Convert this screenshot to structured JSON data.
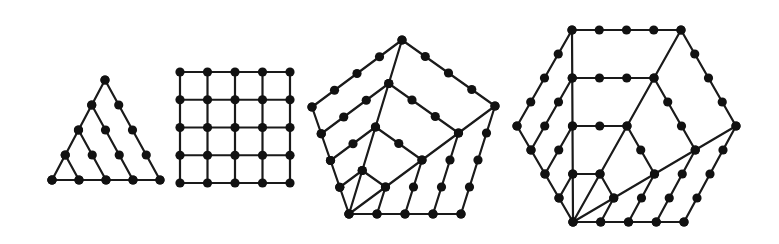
{
  "colors": {
    "line": "#1a1a1a",
    "dot": "#111111",
    "background": "#ffffff"
  },
  "dot_radius": 4.6,
  "figures": [
    {
      "name": "triangular-number",
      "sides": 3,
      "dots_per_side": 5,
      "total_dots": 15,
      "style": "gnomon",
      "vertices": [
        [
          52,
          180
        ],
        [
          160,
          180
        ],
        [
          105,
          80
        ]
      ]
    },
    {
      "name": "square-number",
      "sides": 4,
      "dots_per_side": 5,
      "total_dots": 25,
      "style": "grid",
      "vertices": [
        [
          180,
          183
        ],
        [
          290,
          183
        ],
        [
          290,
          72
        ],
        [
          180,
          72
        ]
      ]
    },
    {
      "name": "pentagonal-number",
      "sides": 5,
      "dots_per_side": 5,
      "total_dots": 35,
      "style": "gnomon",
      "vertices": [
        [
          349,
          214
        ],
        [
          461,
          214
        ],
        [
          495,
          106
        ],
        [
          402,
          40
        ],
        [
          312,
          107
        ]
      ]
    },
    {
      "name": "hexagonal-number",
      "sides": 6,
      "dots_per_side": 5,
      "total_dots": 45,
      "style": "gnomon",
      "vertices": [
        [
          573,
          222
        ],
        [
          684,
          222
        ],
        [
          736,
          126
        ],
        [
          681,
          30
        ],
        [
          572,
          30
        ],
        [
          517,
          126
        ]
      ]
    }
  ]
}
